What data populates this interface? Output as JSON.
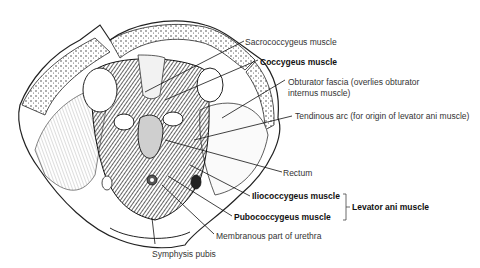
{
  "figure": {
    "labels": [
      {
        "id": "sacrococcygeus",
        "text": "Sacrococcygeus muscle",
        "bold": false
      },
      {
        "id": "coccygeus",
        "text": "Coccygeus muscle",
        "bold": true
      },
      {
        "id": "obturator_fascia_1",
        "text": "Obturator fascia (overlies obturator",
        "bold": false
      },
      {
        "id": "obturator_fascia_2",
        "text": "internus muscle)",
        "bold": false
      },
      {
        "id": "tendinous_arc",
        "text": "Tendinous arc (for origin of levator ani muscle)",
        "bold": false
      },
      {
        "id": "rectum",
        "text": "Rectum",
        "bold": false
      },
      {
        "id": "iliococcygeus",
        "text": "Iliococcygeus muscle",
        "bold": true
      },
      {
        "id": "pubococcygeus",
        "text": "Pubococcygeus muscle",
        "bold": true
      },
      {
        "id": "levator_ani",
        "text": "Levator ani muscle",
        "bold": true
      },
      {
        "id": "membranous_urethra",
        "text": "Membranous part of urethra",
        "bold": false
      },
      {
        "id": "symphysis_pubis",
        "text": "Symphysis pubis",
        "bold": false
      }
    ]
  }
}
